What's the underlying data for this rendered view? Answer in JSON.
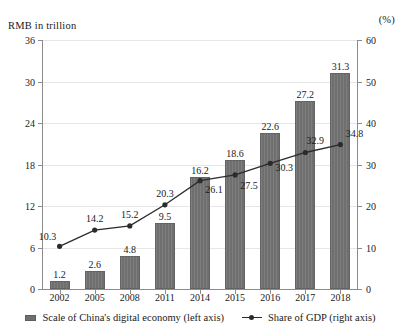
{
  "chart_data": {
    "type": "bar",
    "title": "",
    "xlabel": "",
    "ylabel": "RMB in trillion",
    "y2label": "(%)",
    "categories": [
      "2002",
      "2005",
      "2008",
      "2011",
      "2014",
      "2015",
      "2016",
      "2017",
      "2018"
    ],
    "ylim": [
      0,
      36
    ],
    "y2lim": [
      0,
      60
    ],
    "yticks": [
      "0",
      "6",
      "12",
      "18",
      "24",
      "30",
      "36"
    ],
    "y2ticks": [
      "0",
      "10",
      "20",
      "30",
      "40",
      "50",
      "60"
    ],
    "grid": true,
    "legend_position": "bottom",
    "series": [
      {
        "name": "Scale of China's digital economy (left axis)",
        "type": "bar",
        "axis": "left",
        "color": "#6f6f6f",
        "values": [
          1.2,
          2.6,
          4.8,
          9.5,
          16.2,
          18.6,
          22.6,
          27.2,
          31.3
        ],
        "labels": [
          "1.2",
          "2.6",
          "4.8",
          "9.5",
          "16.2",
          "18.6",
          "22.6",
          "27.2",
          "31.3"
        ]
      },
      {
        "name": "Share of GDP (right axis)",
        "type": "line",
        "axis": "right",
        "color": "#2b2b2b",
        "values": [
          10.3,
          14.2,
          15.2,
          20.3,
          26.1,
          27.5,
          30.3,
          32.9,
          34.8
        ],
        "labels": [
          "10.3",
          "14.2",
          "15.2",
          "20.3",
          "26.1",
          "27.5",
          "30.3",
          "32.9",
          "34.8"
        ]
      }
    ]
  },
  "legend": {
    "bar_label": "Scale of China's digital economy (left axis)",
    "line_label": "Share of GDP (right axis)"
  }
}
